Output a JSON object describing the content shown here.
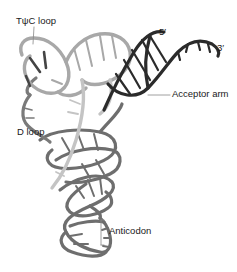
{
  "figure": {
    "labels": {
      "tpsic_loop": "TψC loop",
      "five_prime": "5′",
      "three_prime": "3′",
      "acceptor_arm": "Acceptor arm",
      "d_loop": "D loop",
      "anticodon": "Anticodon"
    },
    "colors": {
      "acceptor_arm": "#2b2b2b",
      "tpsic_arm": "#a8a8a8",
      "d_arm": "#c4c4c4",
      "anticodon_arm": "#6e6e6e",
      "leader_line": "#888888",
      "text": "#1a1a1a"
    }
  }
}
